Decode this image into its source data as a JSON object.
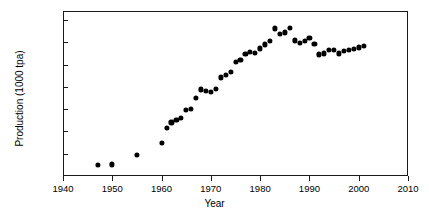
{
  "chart_data": {
    "type": "scatter",
    "title": "",
    "xlabel": "Year",
    "ylabel": "Production (1000 tpa)",
    "xlim": [
      1940,
      2010
    ],
    "ylim": [
      0,
      7400
    ],
    "xticks": [
      1940,
      1950,
      1960,
      1970,
      1980,
      1990,
      2000,
      2010
    ],
    "yticks": [
      1000,
      2000,
      3000,
      4000,
      5000,
      6000,
      7000
    ],
    "grid": false,
    "legend": null,
    "marker": "filled-circle",
    "marker_color": "#000000",
    "series": [
      {
        "name": "Production",
        "x": [
          1947,
          1950,
          1955,
          1960,
          1961,
          1962,
          1963,
          1964,
          1965,
          1966,
          1967,
          1968,
          1969,
          1970,
          1971,
          1972,
          1973,
          1974,
          1975,
          1976,
          1977,
          1978,
          1979,
          1980,
          1981,
          1982,
          1983,
          1984,
          1985,
          1986,
          1987,
          1988,
          1989,
          1990,
          1991,
          1992,
          1993,
          1994,
          1995,
          1996,
          1997,
          1998,
          1999,
          2000,
          2001
        ],
        "y": [
          490,
          520,
          930,
          1500,
          2170,
          2400,
          2500,
          2620,
          2950,
          3020,
          3510,
          3880,
          3830,
          3780,
          3900,
          4420,
          4550,
          4660,
          5100,
          5200,
          5480,
          5580,
          5510,
          5720,
          5900,
          6060,
          6620,
          6380,
          6440,
          6630,
          6080,
          5980,
          6060,
          6200,
          5940,
          5450,
          5500,
          5650,
          5650,
          5500,
          5600,
          5660,
          5700,
          5770,
          5830
        ]
      }
    ]
  },
  "axis": {
    "xtick_labels": [
      "1940",
      "1950",
      "1960",
      "1970",
      "1980",
      "1990",
      "2000",
      "2010"
    ],
    "ytick_labels": [
      "1000",
      "2000",
      "3000",
      "4000",
      "5000",
      "6000",
      "7000"
    ],
    "x_title": "Year",
    "y_title": "Production (1000 tpa)"
  }
}
